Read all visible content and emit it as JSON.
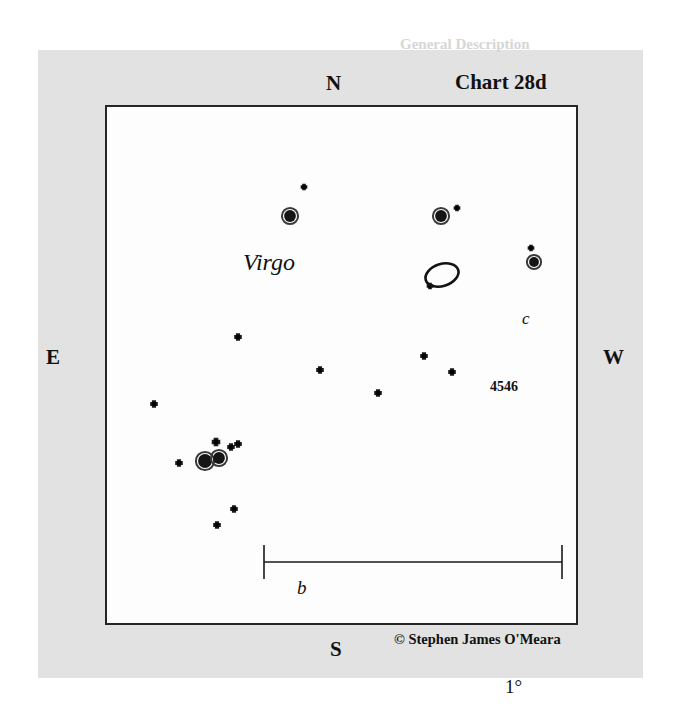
{
  "chart": {
    "title": "Chart 28d",
    "constellation": "Virgo",
    "credit": "© Stephen James O'Meara",
    "compass": {
      "north": "N",
      "south": "S",
      "east": "E",
      "west": "W"
    },
    "scale_bar": {
      "label": "1°",
      "x_start": 264,
      "x_end": 562,
      "y": 562
    },
    "box": {
      "x": 105,
      "y": 105,
      "width": 473,
      "height": 520
    },
    "colors": {
      "page_background": "#e2e2e2",
      "chart_background": "#fdfdfd",
      "ink": "#111111",
      "border": "#262626"
    }
  },
  "chart_data": {
    "type": "scatter",
    "title": "Chart 28d",
    "subtitle": "Virgo",
    "xlabel": "",
    "ylabel": "",
    "axis_note": "Sky chart: N up, S down, E left, W right",
    "xlim": [
      105,
      578
    ],
    "ylim": [
      105,
      625
    ],
    "grid": false,
    "legend": "none",
    "scale_degrees": 1,
    "annotations": [
      {
        "text": "Virgo",
        "x": 136,
        "y": 158,
        "style": "italic"
      },
      {
        "text": "c",
        "x": 420,
        "y": 213,
        "style": "italic"
      },
      {
        "text": "b",
        "x": 196,
        "y": 486,
        "style": "italic"
      },
      {
        "text": "4546",
        "x": 398,
        "y": 283,
        "style": "bold"
      },
      {
        "text": "1°",
        "x": 406,
        "y": 581,
        "style": "normal"
      }
    ],
    "objects": [
      {
        "name": "galaxy-ngc-4546",
        "type": "galaxy",
        "label": "4546",
        "x": 442,
        "y": 275,
        "rx": 17,
        "ry": 11,
        "angle": -18
      }
    ],
    "stars": [
      {
        "id": "s1",
        "x": 304,
        "y": 187,
        "mag_size": 7,
        "label": ""
      },
      {
        "id": "s2",
        "x": 290,
        "y": 216,
        "mag_size": 13,
        "label": ""
      },
      {
        "id": "s3",
        "x": 441,
        "y": 216,
        "mag_size": 13,
        "label": "c"
      },
      {
        "id": "s4",
        "x": 457,
        "y": 208,
        "mag_size": 7,
        "label": ""
      },
      {
        "id": "s5",
        "x": 531,
        "y": 248,
        "mag_size": 7,
        "label": ""
      },
      {
        "id": "s6",
        "x": 534,
        "y": 262,
        "mag_size": 11,
        "label": ""
      },
      {
        "id": "s7",
        "x": 430,
        "y": 286,
        "mag_size": 7,
        "label": ""
      },
      {
        "id": "s8",
        "x": 238,
        "y": 337,
        "mag_size": 8,
        "label": ""
      },
      {
        "id": "s9",
        "x": 320,
        "y": 370,
        "mag_size": 8,
        "label": ""
      },
      {
        "id": "s10",
        "x": 424,
        "y": 356,
        "mag_size": 8,
        "label": ""
      },
      {
        "id": "s11",
        "x": 452,
        "y": 372,
        "mag_size": 8,
        "label": ""
      },
      {
        "id": "s12",
        "x": 378,
        "y": 393,
        "mag_size": 8,
        "label": ""
      },
      {
        "id": "s13",
        "x": 154,
        "y": 404,
        "mag_size": 8,
        "label": ""
      },
      {
        "id": "s14",
        "x": 216,
        "y": 442,
        "mag_size": 9,
        "label": ""
      },
      {
        "id": "s15",
        "x": 231,
        "y": 447,
        "mag_size": 8,
        "label": ""
      },
      {
        "id": "s16",
        "x": 238,
        "y": 444,
        "mag_size": 8,
        "label": ""
      },
      {
        "id": "s17",
        "x": 205,
        "y": 461,
        "mag_size": 15,
        "label": "b"
      },
      {
        "id": "s18",
        "x": 219,
        "y": 458,
        "mag_size": 13,
        "label": ""
      },
      {
        "id": "s19",
        "x": 179,
        "y": 463,
        "mag_size": 8,
        "label": ""
      },
      {
        "id": "s20",
        "x": 234,
        "y": 509,
        "mag_size": 8,
        "label": ""
      },
      {
        "id": "s21",
        "x": 217,
        "y": 525,
        "mag_size": 8,
        "label": ""
      }
    ]
  },
  "ghost_text": {
    "lines": [
      {
        "text": "General Description",
        "x": 400,
        "y": 36,
        "size": 15,
        "weight": "bold"
      },
      {
        "text": "The lenticular galaxy NGC 4546 lies in a rich",
        "x": 170,
        "y": 140,
        "size": 15,
        "weight": "normal"
      },
      {
        "text": "region of western Virgo, some 4° southwest of",
        "x": 170,
        "y": 166,
        "size": 15,
        "weight": "normal"
      },
      {
        "text": "the bright star Gamma Virginis, also known as",
        "x": 170,
        "y": 274,
        "size": 15,
        "weight": "normal"
      },
      {
        "text": "Porrima. A small telescope shows the galaxy as",
        "x": 170,
        "y": 300,
        "size": 15,
        "weight": "normal"
      },
      {
        "text": "a tiny oval glow with a condensed core, while",
        "x": 170,
        "y": 326,
        "size": 15,
        "weight": "normal"
      },
      {
        "text": "larger apertures reveal a subtle mottling in the",
        "x": 170,
        "y": 352,
        "size": 15,
        "weight": "normal"
      },
      {
        "text": "halo and a faint stellar nucleus at its center.",
        "x": 170,
        "y": 378,
        "size": 15,
        "weight": "normal"
      },
      {
        "text": "The Galaxy in Detail",
        "x": 170,
        "y": 452,
        "size": 20,
        "weight": "bold"
      },
      {
        "text": "With an 8-inch scope under dark skies",
        "x": 170,
        "y": 497,
        "size": 15,
        "weight": "normal"
      }
    ]
  }
}
